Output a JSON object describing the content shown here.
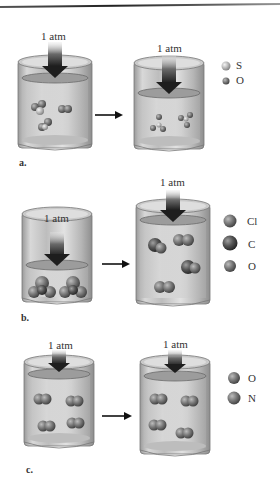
{
  "figure": {
    "panels": [
      {
        "id": "a",
        "label": "a.",
        "left_pressure": "1 atm",
        "right_pressure": "1 atm",
        "legend": [
          {
            "symbol": "S",
            "color": "#c8c8c8"
          },
          {
            "symbol": "O",
            "color": "#6e6e6e"
          }
        ]
      },
      {
        "id": "b",
        "label": "b.",
        "left_pressure": "1 atm",
        "right_pressure": "1 atm",
        "legend": [
          {
            "symbol": "Cl",
            "color": "#7a7a7a"
          },
          {
            "symbol": "C",
            "color": "#4e4e4e"
          },
          {
            "symbol": "O",
            "color": "#8a8a8a"
          }
        ]
      },
      {
        "id": "c",
        "label": "c.",
        "left_pressure": "1 atm",
        "right_pressure": "1 atm",
        "legend": [
          {
            "symbol": "O",
            "color": "#808080"
          },
          {
            "symbol": "N",
            "color": "#8c8c8c"
          }
        ]
      }
    ]
  }
}
